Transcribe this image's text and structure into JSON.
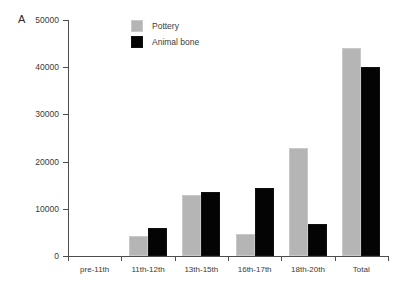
{
  "panel": {
    "label": "A"
  },
  "legend": {
    "position": "top-center",
    "entries": [
      {
        "label": "Pottery",
        "color": "#b5b5b5",
        "swatch": "pottery-swatch"
      },
      {
        "label": "Animal bone",
        "color": "#040404",
        "swatch": "animal-bone-swatch"
      }
    ]
  },
  "axis": {
    "y_ticks": [
      "0",
      "10000",
      "20000",
      "30000",
      "40000",
      "50000"
    ],
    "y_tick_values": [
      0,
      10000,
      20000,
      30000,
      40000,
      50000
    ]
  },
  "chart_data": {
    "type": "bar",
    "title": "",
    "xlabel": "",
    "ylabel": "",
    "ylim": [
      0,
      50000
    ],
    "grid": false,
    "legend_position": "top-center",
    "categories": [
      "pre-11th",
      "11th-12th",
      "13th-15th",
      "16th-17th",
      "18th-20th",
      "Total"
    ],
    "series": [
      {
        "name": "Pottery",
        "color": "#b5b5b5",
        "values": [
          0,
          4200,
          13000,
          4700,
          22900,
          44000
        ]
      },
      {
        "name": "Animal bone",
        "color": "#040404",
        "values": [
          0,
          5900,
          13500,
          14400,
          6800,
          40000
        ]
      }
    ]
  }
}
